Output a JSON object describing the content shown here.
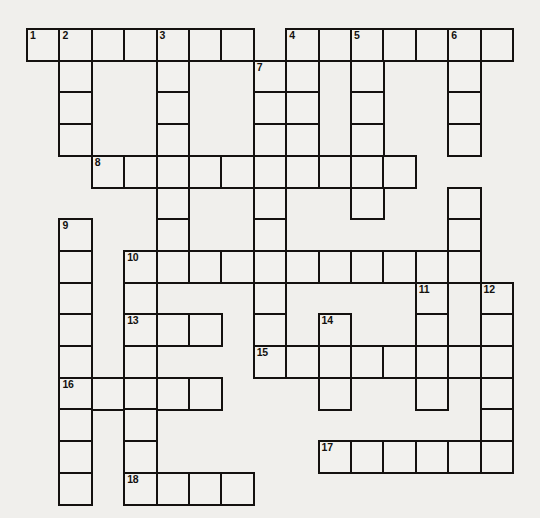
{
  "puzzle": {
    "type": "crossword-grid",
    "title": "Crossword Puzzle Grid",
    "background_color": "#f0efec",
    "cell_color": "#f2f1ee",
    "line_color": "#14110f",
    "columns": 15,
    "rows": 15,
    "cell_width": 32.4,
    "cell_height": 31.7,
    "origin_x": 26,
    "origin_y": 28,
    "cells": [
      {
        "r": 0,
        "c": 0,
        "n": "1"
      },
      {
        "r": 0,
        "c": 1,
        "n": "2"
      },
      {
        "r": 0,
        "c": 2,
        "n": ""
      },
      {
        "r": 0,
        "c": 3,
        "n": ""
      },
      {
        "r": 0,
        "c": 4,
        "n": "3"
      },
      {
        "r": 0,
        "c": 5,
        "n": ""
      },
      {
        "r": 0,
        "c": 6,
        "n": ""
      },
      {
        "r": 0,
        "c": 8,
        "n": "4"
      },
      {
        "r": 0,
        "c": 9,
        "n": ""
      },
      {
        "r": 0,
        "c": 10,
        "n": "5"
      },
      {
        "r": 0,
        "c": 11,
        "n": ""
      },
      {
        "r": 0,
        "c": 12,
        "n": ""
      },
      {
        "r": 0,
        "c": 13,
        "n": "6"
      },
      {
        "r": 0,
        "c": 14,
        "n": ""
      },
      {
        "r": 1,
        "c": 1,
        "n": ""
      },
      {
        "r": 1,
        "c": 4,
        "n": ""
      },
      {
        "r": 1,
        "c": 7,
        "n": "7"
      },
      {
        "r": 1,
        "c": 8,
        "n": ""
      },
      {
        "r": 1,
        "c": 10,
        "n": ""
      },
      {
        "r": 1,
        "c": 13,
        "n": ""
      },
      {
        "r": 2,
        "c": 1,
        "n": ""
      },
      {
        "r": 2,
        "c": 4,
        "n": ""
      },
      {
        "r": 2,
        "c": 7,
        "n": ""
      },
      {
        "r": 2,
        "c": 8,
        "n": ""
      },
      {
        "r": 2,
        "c": 10,
        "n": ""
      },
      {
        "r": 2,
        "c": 13,
        "n": ""
      },
      {
        "r": 3,
        "c": 1,
        "n": ""
      },
      {
        "r": 3,
        "c": 4,
        "n": ""
      },
      {
        "r": 3,
        "c": 7,
        "n": ""
      },
      {
        "r": 3,
        "c": 8,
        "n": ""
      },
      {
        "r": 3,
        "c": 10,
        "n": ""
      },
      {
        "r": 3,
        "c": 13,
        "n": ""
      },
      {
        "r": 4,
        "c": 2,
        "n": "8"
      },
      {
        "r": 4,
        "c": 3,
        "n": ""
      },
      {
        "r": 4,
        "c": 4,
        "n": ""
      },
      {
        "r": 4,
        "c": 5,
        "n": ""
      },
      {
        "r": 4,
        "c": 6,
        "n": ""
      },
      {
        "r": 4,
        "c": 7,
        "n": ""
      },
      {
        "r": 4,
        "c": 8,
        "n": ""
      },
      {
        "r": 4,
        "c": 9,
        "n": ""
      },
      {
        "r": 4,
        "c": 10,
        "n": ""
      },
      {
        "r": 4,
        "c": 11,
        "n": ""
      },
      {
        "r": 5,
        "c": 4,
        "n": ""
      },
      {
        "r": 5,
        "c": 7,
        "n": ""
      },
      {
        "r": 5,
        "c": 10,
        "n": ""
      },
      {
        "r": 5,
        "c": 13,
        "n": ""
      },
      {
        "r": 6,
        "c": 1,
        "n": "9"
      },
      {
        "r": 6,
        "c": 4,
        "n": ""
      },
      {
        "r": 6,
        "c": 7,
        "n": ""
      },
      {
        "r": 6,
        "c": 13,
        "n": ""
      },
      {
        "r": 7,
        "c": 1,
        "n": ""
      },
      {
        "r": 7,
        "c": 3,
        "n": "10"
      },
      {
        "r": 7,
        "c": 4,
        "n": ""
      },
      {
        "r": 7,
        "c": 5,
        "n": ""
      },
      {
        "r": 7,
        "c": 6,
        "n": ""
      },
      {
        "r": 7,
        "c": 7,
        "n": ""
      },
      {
        "r": 7,
        "c": 8,
        "n": ""
      },
      {
        "r": 7,
        "c": 9,
        "n": ""
      },
      {
        "r": 7,
        "c": 10,
        "n": ""
      },
      {
        "r": 7,
        "c": 11,
        "n": ""
      },
      {
        "r": 7,
        "c": 12,
        "n": ""
      },
      {
        "r": 7,
        "c": 13,
        "n": ""
      },
      {
        "r": 8,
        "c": 1,
        "n": ""
      },
      {
        "r": 8,
        "c": 3,
        "n": ""
      },
      {
        "r": 8,
        "c": 7,
        "n": ""
      },
      {
        "r": 8,
        "c": 12,
        "n": "11"
      },
      {
        "r": 8,
        "c": 14,
        "n": "12"
      },
      {
        "r": 9,
        "c": 1,
        "n": ""
      },
      {
        "r": 9,
        "c": 3,
        "n": "13"
      },
      {
        "r": 9,
        "c": 4,
        "n": ""
      },
      {
        "r": 9,
        "c": 5,
        "n": ""
      },
      {
        "r": 9,
        "c": 7,
        "n": ""
      },
      {
        "r": 9,
        "c": 9,
        "n": "14"
      },
      {
        "r": 9,
        "c": 12,
        "n": ""
      },
      {
        "r": 9,
        "c": 14,
        "n": ""
      },
      {
        "r": 10,
        "c": 1,
        "n": ""
      },
      {
        "r": 10,
        "c": 3,
        "n": ""
      },
      {
        "r": 10,
        "c": 7,
        "n": "15"
      },
      {
        "r": 10,
        "c": 8,
        "n": ""
      },
      {
        "r": 10,
        "c": 9,
        "n": ""
      },
      {
        "r": 10,
        "c": 10,
        "n": ""
      },
      {
        "r": 10,
        "c": 11,
        "n": ""
      },
      {
        "r": 10,
        "c": 12,
        "n": ""
      },
      {
        "r": 10,
        "c": 13,
        "n": ""
      },
      {
        "r": 10,
        "c": 14,
        "n": ""
      },
      {
        "r": 11,
        "c": 1,
        "n": "16"
      },
      {
        "r": 11,
        "c": 2,
        "n": ""
      },
      {
        "r": 11,
        "c": 3,
        "n": ""
      },
      {
        "r": 11,
        "c": 4,
        "n": ""
      },
      {
        "r": 11,
        "c": 5,
        "n": ""
      },
      {
        "r": 11,
        "c": 9,
        "n": ""
      },
      {
        "r": 11,
        "c": 12,
        "n": ""
      },
      {
        "r": 11,
        "c": 14,
        "n": ""
      },
      {
        "r": 12,
        "c": 1,
        "n": ""
      },
      {
        "r": 12,
        "c": 3,
        "n": ""
      },
      {
        "r": 12,
        "c": 14,
        "n": ""
      },
      {
        "r": 13,
        "c": 1,
        "n": ""
      },
      {
        "r": 13,
        "c": 3,
        "n": ""
      },
      {
        "r": 13,
        "c": 9,
        "n": "17"
      },
      {
        "r": 13,
        "c": 10,
        "n": ""
      },
      {
        "r": 13,
        "c": 11,
        "n": ""
      },
      {
        "r": 13,
        "c": 12,
        "n": ""
      },
      {
        "r": 13,
        "c": 13,
        "n": ""
      },
      {
        "r": 13,
        "c": 14,
        "n": ""
      },
      {
        "r": 14,
        "c": 1,
        "n": ""
      },
      {
        "r": 14,
        "c": 3,
        "n": "18"
      },
      {
        "r": 14,
        "c": 4,
        "n": ""
      },
      {
        "r": 14,
        "c": 5,
        "n": ""
      },
      {
        "r": 14,
        "c": 6,
        "n": ""
      }
    ]
  }
}
